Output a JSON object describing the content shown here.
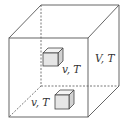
{
  "diagram": {
    "title": "",
    "container": {
      "label": "V, T",
      "label_parts": {
        "var1": "V",
        "sep": ",",
        "var2": "T"
      }
    },
    "subsystems": [
      {
        "id": "subsystem-upper",
        "label": "v, T",
        "label_parts": {
          "var1": "v",
          "sep": ",",
          "var2": "T"
        }
      },
      {
        "id": "subsystem-lower",
        "label": "v, T",
        "label_parts": {
          "var1": "v",
          "sep": ",",
          "var2": "T"
        }
      }
    ],
    "colors": {
      "edge": "#555555",
      "cube_fill": "#e6e6e6",
      "label": "#333333",
      "background": "#ffffff"
    }
  }
}
